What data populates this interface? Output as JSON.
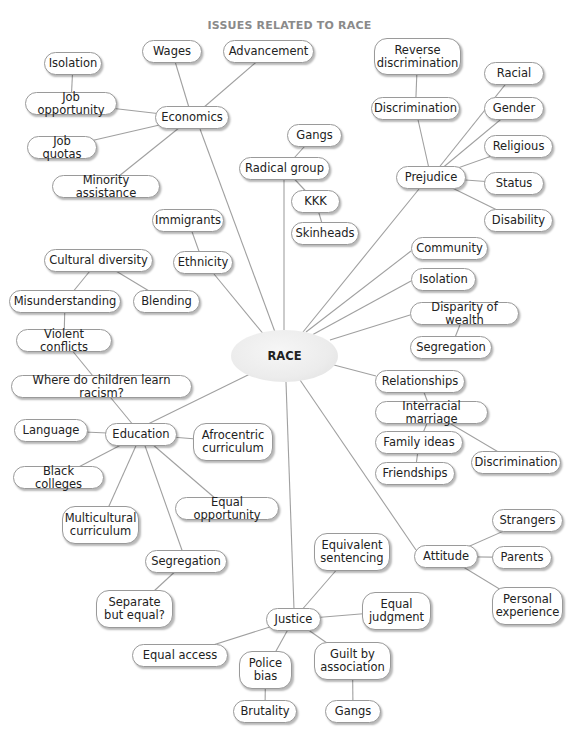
{
  "title": "ISSUES RELATED TO RACE",
  "center": {
    "id": "race",
    "label": "RACE",
    "x": 231,
    "y": 330,
    "w": 107,
    "h": 52
  },
  "nodes": [
    {
      "id": "wages",
      "label": "Wages",
      "x": 142,
      "y": 40,
      "w": 60,
      "h": 23
    },
    {
      "id": "advancement",
      "label": "Advancement",
      "x": 223,
      "y": 40,
      "w": 91,
      "h": 23
    },
    {
      "id": "isolation1",
      "label": "Isolation",
      "x": 44,
      "y": 52,
      "w": 58,
      "h": 23
    },
    {
      "id": "job_opportunity",
      "label": "Job opportunity",
      "x": 25,
      "y": 92,
      "w": 92,
      "h": 23
    },
    {
      "id": "economics",
      "label": "Economics",
      "x": 155,
      "y": 106,
      "w": 74,
      "h": 23
    },
    {
      "id": "job_quotas",
      "label": "Job quotas",
      "x": 27,
      "y": 136,
      "w": 70,
      "h": 23
    },
    {
      "id": "minority_assistance",
      "label": "Minority assistance",
      "x": 52,
      "y": 175,
      "w": 108,
      "h": 23
    },
    {
      "id": "gangs1",
      "label": "Gangs",
      "x": 287,
      "y": 124,
      "w": 55,
      "h": 23
    },
    {
      "id": "radical_group",
      "label": "Radical group",
      "x": 239,
      "y": 157,
      "w": 91,
      "h": 23
    },
    {
      "id": "kkk",
      "label": "KKK",
      "x": 291,
      "y": 190,
      "w": 49,
      "h": 23
    },
    {
      "id": "skinheads",
      "label": "Skinheads",
      "x": 291,
      "y": 222,
      "w": 68,
      "h": 23
    },
    {
      "id": "reverse_discrimination",
      "label": "Reverse\ndiscrimination",
      "x": 374,
      "y": 38,
      "w": 87,
      "h": 37
    },
    {
      "id": "discrimination1",
      "label": "Discrimination",
      "x": 371,
      "y": 97,
      "w": 89,
      "h": 23
    },
    {
      "id": "racial",
      "label": "Racial",
      "x": 484,
      "y": 62,
      "w": 60,
      "h": 23
    },
    {
      "id": "gender",
      "label": "Gender",
      "x": 484,
      "y": 97,
      "w": 60,
      "h": 23
    },
    {
      "id": "religious",
      "label": "Religious",
      "x": 484,
      "y": 135,
      "w": 69,
      "h": 23
    },
    {
      "id": "status",
      "label": "Status",
      "x": 484,
      "y": 172,
      "w": 60,
      "h": 23
    },
    {
      "id": "disability",
      "label": "Disability",
      "x": 484,
      "y": 209,
      "w": 69,
      "h": 23
    },
    {
      "id": "prejudice",
      "label": "Prejudice",
      "x": 396,
      "y": 166,
      "w": 70,
      "h": 23
    },
    {
      "id": "immigrants",
      "label": "Immigrants",
      "x": 152,
      "y": 209,
      "w": 72,
      "h": 23
    },
    {
      "id": "ethnicity",
      "label": "Ethnicity",
      "x": 173,
      "y": 251,
      "w": 60,
      "h": 23
    },
    {
      "id": "cultural_diversity",
      "label": "Cultural diversity",
      "x": 44,
      "y": 249,
      "w": 109,
      "h": 23
    },
    {
      "id": "misunderstanding",
      "label": "Misunderstanding",
      "x": 9,
      "y": 290,
      "w": 112,
      "h": 23
    },
    {
      "id": "blending",
      "label": "Blending",
      "x": 133,
      "y": 290,
      "w": 67,
      "h": 23
    },
    {
      "id": "violent_conflicts",
      "label": "Violent conflicts",
      "x": 16,
      "y": 329,
      "w": 96,
      "h": 23
    },
    {
      "id": "where_children",
      "label": "Where do children learn racism?",
      "x": 11,
      "y": 375,
      "w": 181,
      "h": 23
    },
    {
      "id": "community",
      "label": "Community",
      "x": 411,
      "y": 237,
      "w": 77,
      "h": 23
    },
    {
      "id": "isolation2",
      "label": "Isolation",
      "x": 411,
      "y": 268,
      "w": 65,
      "h": 23
    },
    {
      "id": "disparity_of_wealth",
      "label": "Disparity of wealth",
      "x": 410,
      "y": 302,
      "w": 109,
      "h": 23
    },
    {
      "id": "segregation1",
      "label": "Segregation",
      "x": 410,
      "y": 336,
      "w": 82,
      "h": 23
    },
    {
      "id": "relationships",
      "label": "Relationships",
      "x": 375,
      "y": 370,
      "w": 90,
      "h": 23
    },
    {
      "id": "interracial_marriage",
      "label": "Interracial marriage",
      "x": 375,
      "y": 401,
      "w": 113,
      "h": 23
    },
    {
      "id": "family_ideas",
      "label": "Family ideas",
      "x": 375,
      "y": 431,
      "w": 88,
      "h": 23
    },
    {
      "id": "friendships",
      "label": "Friendships",
      "x": 375,
      "y": 462,
      "w": 80,
      "h": 23
    },
    {
      "id": "discrimination2",
      "label": "Discrimination",
      "x": 471,
      "y": 451,
      "w": 90,
      "h": 23
    },
    {
      "id": "language",
      "label": "Language",
      "x": 14,
      "y": 419,
      "w": 74,
      "h": 23
    },
    {
      "id": "education",
      "label": "Education",
      "x": 105,
      "y": 423,
      "w": 72,
      "h": 23
    },
    {
      "id": "afrocentric_curriculum",
      "label": "Afrocentric\ncurriculum",
      "x": 193,
      "y": 423,
      "w": 80,
      "h": 38
    },
    {
      "id": "black_colleges",
      "label": "Black colleges",
      "x": 13,
      "y": 466,
      "w": 91,
      "h": 23
    },
    {
      "id": "multicultural_curriculum",
      "label": "Multicultural\ncurriculum",
      "x": 62,
      "y": 506,
      "w": 77,
      "h": 38
    },
    {
      "id": "equal_opportunity",
      "label": "Equal opportunity",
      "x": 175,
      "y": 497,
      "w": 104,
      "h": 23
    },
    {
      "id": "segregation2",
      "label": "Segregation",
      "x": 145,
      "y": 550,
      "w": 82,
      "h": 23
    },
    {
      "id": "separate_but_equal",
      "label": "Separate\nbut equal?",
      "x": 96,
      "y": 590,
      "w": 77,
      "h": 38
    },
    {
      "id": "justice",
      "label": "Justice",
      "x": 266,
      "y": 608,
      "w": 55,
      "h": 23
    },
    {
      "id": "equivalent_sentencing",
      "label": "Equivalent\nsentencing",
      "x": 314,
      "y": 533,
      "w": 76,
      "h": 38
    },
    {
      "id": "equal_judgment",
      "label": "Equal\njudgment",
      "x": 362,
      "y": 592,
      "w": 69,
      "h": 38
    },
    {
      "id": "equal_access",
      "label": "Equal access",
      "x": 132,
      "y": 644,
      "w": 96,
      "h": 23
    },
    {
      "id": "police_bias",
      "label": "Police\nbias",
      "x": 239,
      "y": 651,
      "w": 53,
      "h": 38
    },
    {
      "id": "guilt_by_association",
      "label": "Guilt by\nassociation",
      "x": 314,
      "y": 642,
      "w": 77,
      "h": 38
    },
    {
      "id": "brutality",
      "label": "Brutality",
      "x": 233,
      "y": 700,
      "w": 64,
      "h": 23
    },
    {
      "id": "gangs2",
      "label": "Gangs",
      "x": 325,
      "y": 700,
      "w": 56,
      "h": 23
    },
    {
      "id": "attitude",
      "label": "Attitude",
      "x": 414,
      "y": 545,
      "w": 64,
      "h": 23
    },
    {
      "id": "strangers",
      "label": "Strangers",
      "x": 492,
      "y": 509,
      "w": 71,
      "h": 23
    },
    {
      "id": "parents",
      "label": "Parents",
      "x": 492,
      "y": 546,
      "w": 60,
      "h": 23
    },
    {
      "id": "personal_experience",
      "label": "Personal\nexperience",
      "x": 492,
      "y": 587,
      "w": 71,
      "h": 38
    }
  ],
  "edges": [
    [
      "race",
      "economics",
      275,
      332,
      200,
      129
    ],
    [
      "economics",
      "wages",
      0,
      0,
      0,
      0
    ],
    [
      "economics",
      "advancement",
      0,
      0,
      0,
      0
    ],
    [
      "economics",
      "job_opportunity",
      0,
      0,
      0,
      0
    ],
    [
      "economics",
      "job_quotas",
      0,
      0,
      0,
      0
    ],
    [
      "economics",
      "minority_assistance",
      0,
      0,
      0,
      0
    ],
    [
      "job_opportunity",
      "isolation1",
      0,
      0,
      0,
      0
    ],
    [
      "race",
      "radical_group",
      284,
      330,
      284,
      180
    ],
    [
      "radical_group",
      "gangs1",
      0,
      0,
      0,
      0
    ],
    [
      "radical_group",
      "kkk",
      0,
      0,
      0,
      0
    ],
    [
      "kkk",
      "skinheads",
      0,
      0,
      0,
      0
    ],
    [
      "race",
      "prejudice",
      303,
      332,
      419,
      189
    ],
    [
      "prejudice",
      "discrimination1",
      0,
      0,
      0,
      0
    ],
    [
      "discrimination1",
      "reverse_discrimination",
      0,
      0,
      0,
      0
    ],
    [
      "prejudice",
      "racial",
      0,
      0,
      0,
      0
    ],
    [
      "prejudice",
      "gender",
      0,
      0,
      0,
      0
    ],
    [
      "prejudice",
      "religious",
      0,
      0,
      0,
      0
    ],
    [
      "prejudice",
      "status",
      0,
      0,
      0,
      0
    ],
    [
      "prejudice",
      "disability",
      0,
      0,
      0,
      0
    ],
    [
      "race",
      "ethnicity",
      265,
      336,
      214,
      274
    ],
    [
      "ethnicity",
      "immigrants",
      0,
      0,
      0,
      0
    ],
    [
      "race",
      "community",
      306,
      332,
      411,
      251
    ],
    [
      "race",
      "isolation2",
      312,
      335,
      411,
      281
    ],
    [
      "race",
      "disparity_of_wealth",
      330,
      340,
      410,
      315
    ],
    [
      "disparity_of_wealth",
      "segregation1",
      0,
      0,
      0,
      0
    ],
    [
      "race",
      "relationships",
      334,
      365,
      376,
      376
    ],
    [
      "relationships",
      "interracial_marriage",
      0,
      0,
      0,
      0
    ],
    [
      "interracial_marriage",
      "family_ideas",
      0,
      0,
      0,
      0
    ],
    [
      "family_ideas",
      "friendships",
      0,
      0,
      0,
      0
    ],
    [
      "interracial_marriage",
      "discrimination2",
      0,
      0,
      0,
      0
    ],
    [
      "race",
      "education",
      250,
      374,
      148,
      424
    ],
    [
      "education",
      "where_children",
      0,
      0,
      0,
      0
    ],
    [
      "where_children",
      "violent_conflicts",
      0,
      0,
      0,
      0
    ],
    [
      "violent_conflicts",
      "misunderstanding",
      0,
      0,
      0,
      0
    ],
    [
      "misunderstanding",
      "cultural_diversity",
      0,
      0,
      0,
      0
    ],
    [
      "cultural_diversity",
      "blending",
      0,
      0,
      0,
      0
    ],
    [
      "education",
      "language",
      0,
      0,
      0,
      0
    ],
    [
      "education",
      "afrocentric_curriculum",
      0,
      0,
      0,
      0
    ],
    [
      "education",
      "black_colleges",
      0,
      0,
      0,
      0
    ],
    [
      "education",
      "multicultural_curriculum",
      0,
      0,
      0,
      0
    ],
    [
      "education",
      "equal_opportunity",
      0,
      0,
      0,
      0
    ],
    [
      "education",
      "segregation2",
      0,
      0,
      0,
      0
    ],
    [
      "segregation2",
      "separate_but_equal",
      0,
      0,
      0,
      0
    ],
    [
      "race",
      "justice",
      286,
      382,
      294,
      609
    ],
    [
      "justice",
      "equivalent_sentencing",
      0,
      0,
      0,
      0
    ],
    [
      "justice",
      "equal_judgment",
      0,
      0,
      0,
      0
    ],
    [
      "justice",
      "equal_access",
      0,
      0,
      0,
      0
    ],
    [
      "justice",
      "police_bias",
      0,
      0,
      0,
      0
    ],
    [
      "justice",
      "guilt_by_association",
      0,
      0,
      0,
      0
    ],
    [
      "police_bias",
      "brutality",
      0,
      0,
      0,
      0
    ],
    [
      "guilt_by_association",
      "gangs2",
      0,
      0,
      0,
      0
    ],
    [
      "race",
      "attitude",
      300,
      380,
      416,
      550
    ],
    [
      "attitude",
      "strangers",
      0,
      0,
      0,
      0
    ],
    [
      "attitude",
      "parents",
      0,
      0,
      0,
      0
    ],
    [
      "attitude",
      "personal_experience",
      0,
      0,
      0,
      0
    ]
  ],
  "colors": {
    "title": "#8a8a8a",
    "line": "#a0a0a0",
    "node_border": "#9a9a9a",
    "node_fill": "#ffffff",
    "center_fill": "#ececec",
    "text": "#222222"
  }
}
